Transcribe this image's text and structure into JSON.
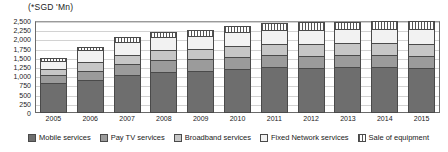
{
  "chart": {
    "unit_title": "(*SGD 'Mn)"
  },
  "chart_data": {
    "type": "bar",
    "subtype": "stacked-column",
    "title": "(*SGD 'Mn)",
    "xlabel": "",
    "ylabel": "(*SGD 'Mn)",
    "ylim": [
      0,
      2500
    ],
    "grid": true,
    "legend_position": "bottom",
    "yticks": [
      "0",
      "250",
      "500",
      "750",
      "1,000",
      "1,250",
      "1,500",
      "1,750",
      "2,000",
      "2,250",
      "2,500"
    ],
    "ytick_values": [
      0,
      250,
      500,
      750,
      1000,
      1250,
      1500,
      1750,
      2000,
      2250,
      2500
    ],
    "categories": [
      "2005",
      "2006",
      "2007",
      "2008",
      "2009",
      "2010",
      "2011",
      "2012",
      "2013",
      "2014",
      "2015"
    ],
    "series": [
      {
        "name": "Mobile services",
        "color": "#6e6e6e",
        "values": [
          820,
          900,
          1030,
          1120,
          1130,
          1190,
          1240,
          1230,
          1240,
          1250,
          1230
        ]
      },
      {
        "name": "Pay TV services",
        "color": "#9b9b9b",
        "values": [
          200,
          250,
          300,
          320,
          330,
          340,
          340,
          330,
          330,
          320,
          310
        ]
      },
      {
        "name": "Broadband services",
        "color": "#c6c6c6",
        "values": [
          170,
          230,
          250,
          270,
          280,
          290,
          300,
          310,
          320,
          330,
          340
        ]
      },
      {
        "name": "Fixed Network services",
        "color": "#f2f2f2",
        "values": [
          230,
          320,
          340,
          350,
          360,
          370,
          380,
          390,
          390,
          390,
          390
        ]
      },
      {
        "name": "Sale of equipment",
        "color": "#ffffff",
        "pattern": "vertical-stripes",
        "values": [
          80,
          100,
          140,
          140,
          150,
          170,
          190,
          200,
          200,
          210,
          230
        ]
      }
    ],
    "totals": [
      1500,
      1800,
      2060,
      2200,
      2250,
      2360,
      2450,
      2460,
      2480,
      2500,
      2500
    ]
  },
  "legend": {
    "items": [
      {
        "label": "Mobile services",
        "swatch": "sw-mobile"
      },
      {
        "label": "Pay TV services",
        "swatch": "sw-paytv"
      },
      {
        "label": "Broadband services",
        "swatch": "sw-broadband"
      },
      {
        "label": "Fixed Network services",
        "swatch": "sw-fixed"
      },
      {
        "label": "Sale of equipment",
        "swatch": "sw-equip"
      }
    ]
  }
}
